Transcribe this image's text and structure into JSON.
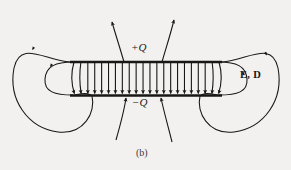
{
  "figure": {
    "caption": "(b)",
    "background_color": "#f2f1ef",
    "ink_color": "#171717",
    "width": 291,
    "height": 170
  },
  "labels": {
    "positive_charge": "+Q",
    "negative_charge": "−Q",
    "field_vectors": "E, D"
  },
  "chart_data": {
    "type": "diagram",
    "subtitle": "(b)",
    "annotations": [
      "+Q",
      "−Q",
      "E, D"
    ],
    "elements": {
      "plates": [
        {
          "name": "top-plate",
          "charge": "+Q",
          "x1": 70,
          "x2": 222,
          "y": 62
        },
        {
          "name": "bottom-plate",
          "charge": "−Q",
          "x1": 70,
          "x2": 222,
          "y": 95
        }
      ],
      "uniform_field_arrows": {
        "count": 22,
        "direction": "down",
        "from_y": 62,
        "to_y": 95,
        "x_start": 74,
        "x_end": 219
      },
      "fringing_field_lines": {
        "top_center_count": 2,
        "bottom_center_count": 2,
        "direction": "up"
      },
      "return_loops": [
        {
          "name": "left-outer-loop",
          "cx": 57,
          "cy": 79,
          "rx": 44,
          "ry": 57
        },
        {
          "name": "left-inner-loop",
          "cx": 68,
          "cy": 79,
          "rx": 24,
          "ry": 31
        },
        {
          "name": "right-outer-loop",
          "cx": 234,
          "cy": 79,
          "rx": 44,
          "ry": 57
        },
        {
          "name": "right-inner-loop",
          "cx": 223,
          "cy": 79,
          "rx": 24,
          "ry": 31
        }
      ]
    }
  }
}
